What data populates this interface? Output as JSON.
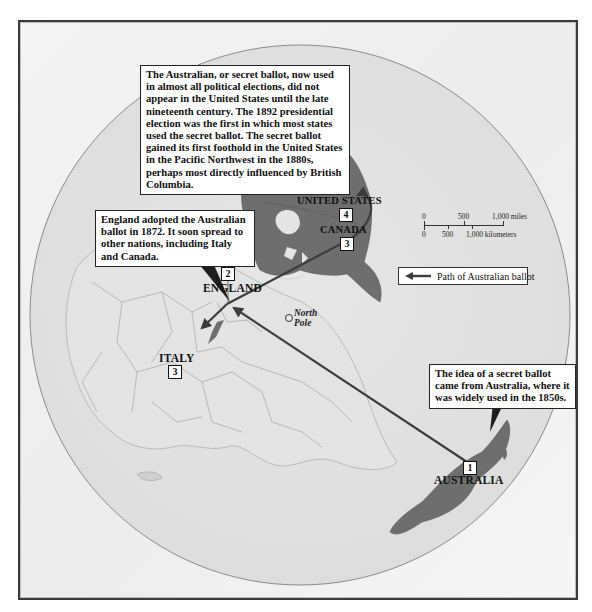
{
  "colors": {
    "frame_border": "#3a3a3a",
    "ocean": "#ececec",
    "land_base": "#dedede",
    "highlighted_land": "#6e6e6e",
    "path_line": "#3c3c3c",
    "callout_bg": "#ffffff"
  },
  "callouts": {
    "united_states": "The Australian, or secret ballot, now used in almost all political elections, did not appear in the United States until the late nineteenth century. The 1892 presidential election was the first in which most states used the secret ballot. The secret ballot gained its first foothold in the United States in the Pacific Northwest in the 1880s, perhaps most directly influenced by British Columbia.",
    "england": "England adopted the Australian ballot in 1872. It soon spread to other nations, including Italy and Canada.",
    "australia": "The idea of a secret ballot came from Australia, where it was widely used in the 1850s."
  },
  "places": [
    {
      "name": "AUSTRALIA",
      "step": "1"
    },
    {
      "name": "ENGLAND",
      "step": "2"
    },
    {
      "name": "CANADA",
      "step": "3"
    },
    {
      "name": "ITALY",
      "step": "3"
    },
    {
      "name": "UNITED STATES",
      "step": "4"
    }
  ],
  "north_pole": {
    "line1": "North",
    "line2": "Pole",
    "icon": "circle-marker-icon"
  },
  "scale": {
    "miles": [
      "0",
      "500",
      "1,000 miles"
    ],
    "kilometers": [
      "0",
      "500",
      "1,000 kilometers"
    ]
  },
  "legend": {
    "icon": "arrow-left-icon",
    "label": "Path of Australian ballot"
  }
}
